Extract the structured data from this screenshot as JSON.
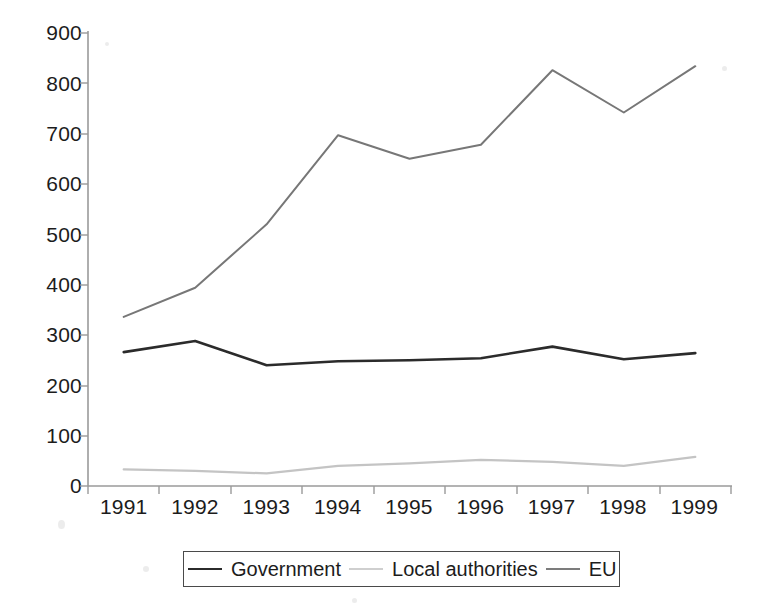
{
  "chart_data": {
    "type": "line",
    "title": "",
    "subtitle": "",
    "xlabel": "",
    "ylabel": "",
    "categories": [
      "1991",
      "1992",
      "1993",
      "1994",
      "1995",
      "1996",
      "1997",
      "1998",
      "1999"
    ],
    "ylim": [
      0,
      900
    ],
    "y_ticks": [
      0,
      100,
      200,
      300,
      400,
      500,
      600,
      700,
      800,
      900
    ],
    "y_tick_labels": [
      "0",
      "100",
      "200",
      "300",
      "400",
      "500",
      "600",
      "700",
      "800",
      "900"
    ],
    "grid": false,
    "legend_position": "bottom",
    "series": [
      {
        "name": "Government",
        "color": "#2b2b2b",
        "width": 2.6,
        "values": [
          266,
          288,
          240,
          248,
          250,
          254,
          277,
          252,
          264
        ]
      },
      {
        "name": "Local authorities",
        "color": "#c4c4c4",
        "width": 2.2,
        "values": [
          33,
          30,
          25,
          40,
          45,
          52,
          48,
          40,
          58
        ]
      },
      {
        "name": "EU",
        "color": "#777777",
        "width": 2.0,
        "values": [
          336,
          394,
          520,
          697,
          650,
          678,
          826,
          742,
          834
        ]
      }
    ]
  },
  "axes": {
    "axis_color": "#9a9a9a",
    "tick_color": "#9a9a9a"
  },
  "legend": {
    "entries": [
      {
        "label": "Government",
        "series": "Government"
      },
      {
        "label": "Local authorities",
        "series": "Local authorities"
      },
      {
        "label": "EU",
        "series": "EU"
      }
    ]
  }
}
